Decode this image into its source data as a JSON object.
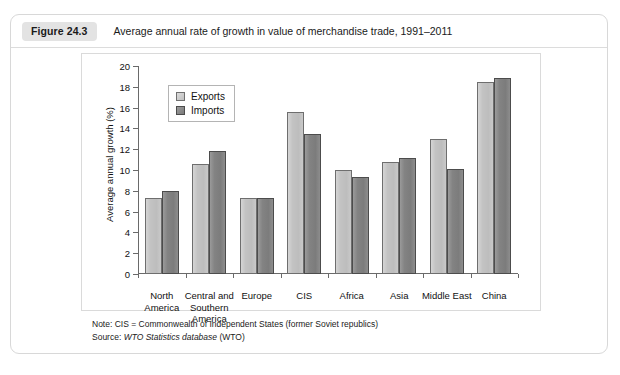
{
  "figure": {
    "badge": "Figure 24.3",
    "caption": "Average annual rate of growth in value of merchandise trade, 1991–2011"
  },
  "footnotes": {
    "note_prefix": "Note: CIS = Commonwealth of Independent States (former Soviet republics)",
    "source_prefix": "Source: ",
    "source_italic": "WTO Statistics database",
    "source_suffix": " (WTO)"
  },
  "colors": {
    "exports_fill": "#c4c4c4",
    "imports_fill": "#828282",
    "axis": "#6a6a6a",
    "card_border": "#d8d8d8",
    "badge_bg": "#e3e3e3"
  },
  "chart_data": {
    "type": "bar",
    "title": "Average annual rate of growth in value of merchandise trade, 1991–2011",
    "xlabel": "",
    "ylabel": "Average annual growth (%)",
    "ylim": [
      0,
      20
    ],
    "ytick_step": 2,
    "yticks": [
      0,
      2,
      4,
      6,
      8,
      10,
      12,
      14,
      16,
      18,
      20
    ],
    "grid": false,
    "legend_position": "top-left-inside",
    "categories": [
      "North\nAmerica",
      "Central and\nSouthern\nAmerica",
      "Europe",
      "CIS",
      "Africa",
      "Asia",
      "Middle East",
      "China"
    ],
    "series": [
      {
        "name": "Exports",
        "values": [
          7.3,
          10.6,
          7.3,
          15.6,
          10.0,
          10.8,
          13.0,
          18.5
        ]
      },
      {
        "name": "Imports",
        "values": [
          8.0,
          11.8,
          7.3,
          13.5,
          9.3,
          11.2,
          10.1,
          18.8
        ]
      }
    ]
  }
}
